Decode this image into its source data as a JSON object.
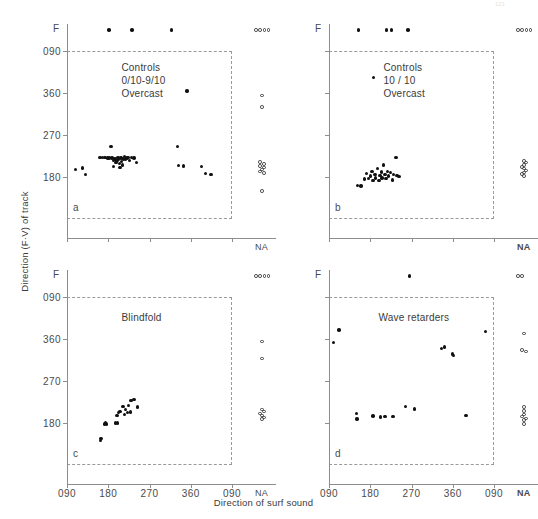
{
  "figure": {
    "page_number": "121",
    "y_axis_title": "Direction (F·V) of track",
    "x_axis_title": "Direction of surf sound",
    "y_ticks": [
      "090",
      "360",
      "270",
      "180"
    ],
    "x_ticks": [
      "090",
      "180",
      "270",
      "360",
      "090"
    ],
    "f_label": "F",
    "na_label": "NA"
  },
  "chart_data": {
    "type": "scatter",
    "xlabel": "Direction of surf sound",
    "ylabel": "Direction (F·V) of track",
    "xlim": [
      90,
      450
    ],
    "ylim": [
      90,
      450
    ],
    "x_tick_values": [
      90,
      180,
      270,
      360,
      450
    ],
    "x_tick_labels": [
      "090",
      "180",
      "270",
      "360",
      "090"
    ],
    "y_tick_values": [
      450,
      360,
      270,
      180
    ],
    "y_tick_labels": [
      "090",
      "360",
      "270",
      "180"
    ],
    "grid": false,
    "legend": "none",
    "extra_categories": {
      "F": "non-oriented / free row plotted above the plot frame",
      "NA": "not applicable column plotted right of the plot frame"
    },
    "marker_types": {
      "filled": "individual track",
      "open": "NA / F category entry"
    },
    "panels": [
      {
        "id": "a",
        "letter": "a",
        "annotation": [
          "Controls",
          "0/10-9/10",
          "Overcast"
        ],
        "annotation_marker": false,
        "points": [
          [
            109,
            196
          ],
          [
            124,
            199
          ],
          [
            130,
            185
          ],
          [
            162,
            222
          ],
          [
            167,
            222
          ],
          [
            173,
            222
          ],
          [
            178,
            221
          ],
          [
            182,
            221
          ],
          [
            186,
            246
          ],
          [
            188,
            221
          ],
          [
            191,
            215
          ],
          [
            191,
            203
          ],
          [
            195,
            219
          ],
          [
            197,
            211
          ],
          [
            199,
            216
          ],
          [
            201,
            222
          ],
          [
            203,
            217
          ],
          [
            205,
            209
          ],
          [
            206,
            200
          ],
          [
            208,
            221
          ],
          [
            209,
            213
          ],
          [
            211,
            206
          ],
          [
            213,
            219
          ],
          [
            216,
            224
          ],
          [
            218,
            217
          ],
          [
            221,
            221
          ],
          [
            224,
            222
          ],
          [
            227,
            215
          ],
          [
            231,
            222
          ],
          [
            236,
            221
          ],
          [
            241,
            211
          ],
          [
            331,
            246
          ],
          [
            333,
            205
          ],
          [
            344,
            204
          ],
          [
            352,
            364
          ],
          [
            384,
            203
          ],
          [
            392,
            188
          ],
          [
            404,
            186
          ]
        ],
        "f_row_x": [
          182,
          232,
          318
        ],
        "f_row_na_count": 4,
        "na_points_y": [
          355,
          330,
          212,
          208,
          204,
          200,
          196,
          192,
          188,
          150
        ],
        "na_points_x_jitter": [
          0,
          0,
          -2,
          2,
          -2,
          2,
          0,
          -2,
          2,
          0
        ]
      },
      {
        "id": "b",
        "letter": "b",
        "annotation": [
          "Controls",
          "10 / 10",
          "Overcast"
        ],
        "annotation_marker": true,
        "points": [
          [
            152,
            162
          ],
          [
            160,
            161
          ],
          [
            168,
            176
          ],
          [
            172,
            188
          ],
          [
            176,
            177
          ],
          [
            181,
            182
          ],
          [
            184,
            192
          ],
          [
            186,
            173
          ],
          [
            190,
            186
          ],
          [
            192,
            178
          ],
          [
            196,
            198
          ],
          [
            199,
            172
          ],
          [
            201,
            183
          ],
          [
            204,
            191
          ],
          [
            206,
            178
          ],
          [
            209,
            206
          ],
          [
            212,
            186
          ],
          [
            214,
            177
          ],
          [
            217,
            192
          ],
          [
            220,
            182
          ],
          [
            224,
            190
          ],
          [
            228,
            174
          ],
          [
            231,
            186
          ],
          [
            236,
            222
          ],
          [
            238,
            183
          ],
          [
            243,
            181
          ]
        ],
        "f_row_x": [
          155,
          215,
          226,
          262
        ],
        "f_row_na_count": 4,
        "na_points_y": [
          214,
          211,
          206,
          202,
          198,
          194,
          190,
          186,
          182
        ],
        "na_points_x_jitter": [
          0,
          2,
          0,
          -2,
          0,
          2,
          0,
          -2,
          0
        ]
      },
      {
        "id": "c",
        "letter": "c",
        "annotation": [
          "Blindfold"
        ],
        "annotation_marker": false,
        "points": [
          [
            163,
            142
          ],
          [
            164,
            147
          ],
          [
            172,
            178
          ],
          [
            174,
            181
          ],
          [
            176,
            178
          ],
          [
            196,
            180
          ],
          [
            200,
            180
          ],
          [
            199,
            196
          ],
          [
            203,
            203
          ],
          [
            206,
            205
          ],
          [
            212,
            216
          ],
          [
            215,
            198
          ],
          [
            218,
            209
          ],
          [
            222,
            202
          ],
          [
            224,
            218
          ],
          [
            228,
            204
          ],
          [
            230,
            228
          ],
          [
            236,
            231
          ],
          [
            244,
            214
          ]
        ],
        "f_row_x": [],
        "f_row_na_count": 4,
        "na_points_y": [
          355,
          318,
          209,
          205,
          200,
          196,
          192,
          188
        ],
        "na_points_x_jitter": [
          0,
          0,
          0,
          2,
          -2,
          0,
          2,
          0
        ]
      },
      {
        "id": "d",
        "letter": "d",
        "annotation": [
          "Wave retarders"
        ],
        "annotation_marker": false,
        "points": [
          [
            100,
            352
          ],
          [
            112,
            379
          ],
          [
            150,
            200
          ],
          [
            151,
            189
          ],
          [
            186,
            195
          ],
          [
            203,
            193
          ],
          [
            212,
            194
          ],
          [
            230,
            194
          ],
          [
            257,
            216
          ],
          [
            276,
            210
          ],
          [
            336,
            340
          ],
          [
            342,
            343
          ],
          [
            360,
            328
          ],
          [
            361,
            325
          ],
          [
            389,
            196
          ],
          [
            431,
            376
          ]
        ],
        "f_row_x": [
          265
        ],
        "f_row_na_count": 2,
        "na_points_y": [
          372,
          337,
          333,
          214,
          206,
          198,
          194,
          190,
          186,
          178
        ],
        "na_points_x_jitter": [
          0,
          -2,
          2,
          0,
          0,
          0,
          -2,
          2,
          0,
          0
        ]
      }
    ]
  }
}
